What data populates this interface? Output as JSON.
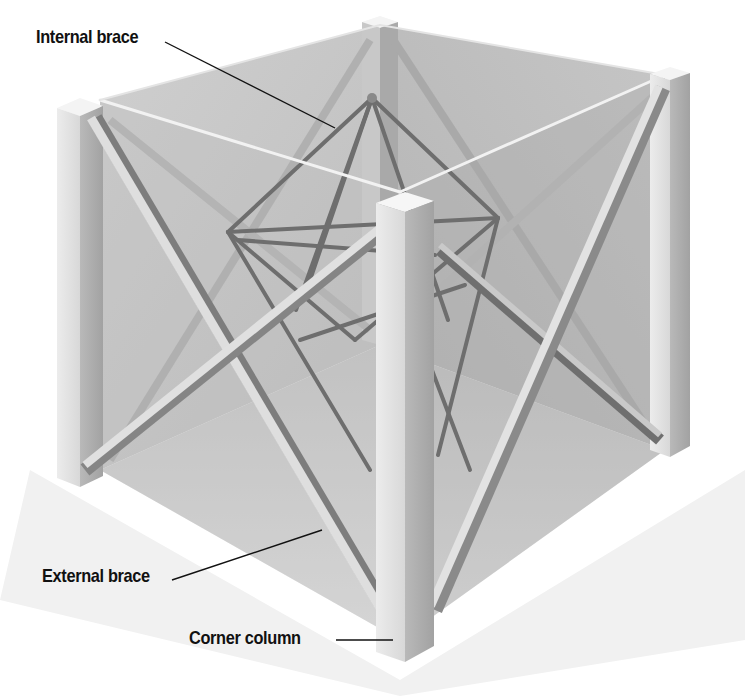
{
  "diagram": {
    "labels": {
      "internal_brace": "Internal brace",
      "external_brace": "External brace",
      "corner_column": "Corner column"
    },
    "colors": {
      "background": "#ffffff",
      "ground_shadow": "#e4e4e4",
      "panel_back": "#c9c9c9",
      "panel_side": "#b8b8b8",
      "column_light": "#e6e6e6",
      "column_dark": "#a9a9a9",
      "brace_light": "#dcdcdc",
      "brace_dark": "#7a7a7a",
      "leader_line": "#111111",
      "label_text": "#111111"
    }
  }
}
